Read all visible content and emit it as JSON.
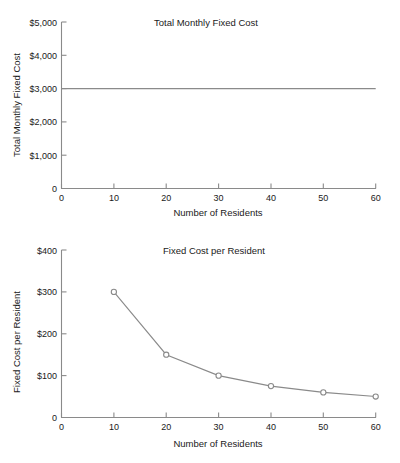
{
  "page": {
    "background": "#ffffff",
    "line_color": "#8a8a8a",
    "text_color": "#1a1a1a"
  },
  "charts": {
    "top": {
      "title": "Total Monthly Fixed Cost",
      "xlabel": "Number of Residents",
      "ylabel": "Total Monthly Fixed Cost",
      "ytick_labels": [
        "$5,000",
        "$4,000",
        "$3,000",
        "$2,000",
        "$1,000",
        "0"
      ],
      "xtick_labels": [
        "0",
        "10",
        "20",
        "30",
        "40",
        "50",
        "60"
      ]
    },
    "bottom": {
      "title": "Fixed Cost per Resident",
      "xlabel": "Number of Residents",
      "ylabel": "Fixed Cost per Resident",
      "ytick_labels": [
        "$400",
        "$300",
        "$200",
        "$100",
        "0"
      ],
      "xtick_labels": [
        "0",
        "10",
        "20",
        "30",
        "40",
        "50",
        "60"
      ]
    }
  },
  "chart_data": [
    {
      "id": "total-monthly-fixed-cost",
      "type": "line",
      "title": "Total Monthly Fixed Cost",
      "xlabel": "Number of Residents",
      "ylabel": "Total Monthly Fixed Cost",
      "x": [
        0,
        10,
        20,
        30,
        40,
        50,
        60
      ],
      "values": [
        3000,
        3000,
        3000,
        3000,
        3000,
        3000,
        3000
      ],
      "series": [
        {
          "name": "Total Monthly Fixed Cost",
          "values": [
            3000,
            3000,
            3000,
            3000,
            3000,
            3000,
            3000
          ]
        }
      ],
      "markers": false,
      "xlim": [
        0,
        60
      ],
      "ylim": [
        0,
        5000
      ],
      "xticks": [
        0,
        10,
        20,
        30,
        40,
        50,
        60
      ],
      "yticks": [
        0,
        1000,
        2000,
        3000,
        4000,
        5000
      ],
      "ytick_labels": [
        "0",
        "$1,000",
        "$2,000",
        "$3,000",
        "$4,000",
        "$5,000"
      ],
      "grid": false,
      "legend": "none"
    },
    {
      "id": "fixed-cost-per-resident",
      "type": "line",
      "title": "Fixed Cost per Resident",
      "xlabel": "Number of Residents",
      "ylabel": "Fixed Cost per Resident",
      "x": [
        10,
        20,
        30,
        40,
        50,
        60
      ],
      "values": [
        300,
        150,
        100,
        75,
        60,
        50
      ],
      "series": [
        {
          "name": "Fixed Cost per Resident",
          "values": [
            300,
            150,
            100,
            75,
            60,
            50
          ]
        }
      ],
      "markers": true,
      "marker_style": "open-circle",
      "xlim": [
        0,
        60
      ],
      "ylim": [
        0,
        400
      ],
      "xticks": [
        0,
        10,
        20,
        30,
        40,
        50,
        60
      ],
      "yticks": [
        0,
        100,
        200,
        300,
        400
      ],
      "ytick_labels": [
        "0",
        "$100",
        "$200",
        "$300",
        "$400"
      ],
      "grid": false,
      "legend": "none"
    }
  ]
}
